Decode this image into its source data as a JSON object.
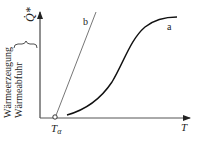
{
  "diagram": {
    "type": "heat balance diagram",
    "y_axis_label_line1": "Wärmeerzeugung",
    "y_axis_label_line2": "Wärmeabfuhr",
    "y_axis_symbol": "Q̇*",
    "x_axis_label": "T",
    "x_marker_label": "Tα",
    "curves": [
      {
        "id": "a",
        "label": "a",
        "shape": "sigmoid",
        "description": "Wärmeerzeugung (S-curve)"
      },
      {
        "id": "b",
        "label": "b",
        "shape": "straight line",
        "description": "Wärmeabfuhr (line from Tα)"
      }
    ],
    "colors": {
      "axis": "#222222",
      "curve_a": "#111111",
      "line_b": "#555555",
      "background": "#ffffff"
    }
  }
}
